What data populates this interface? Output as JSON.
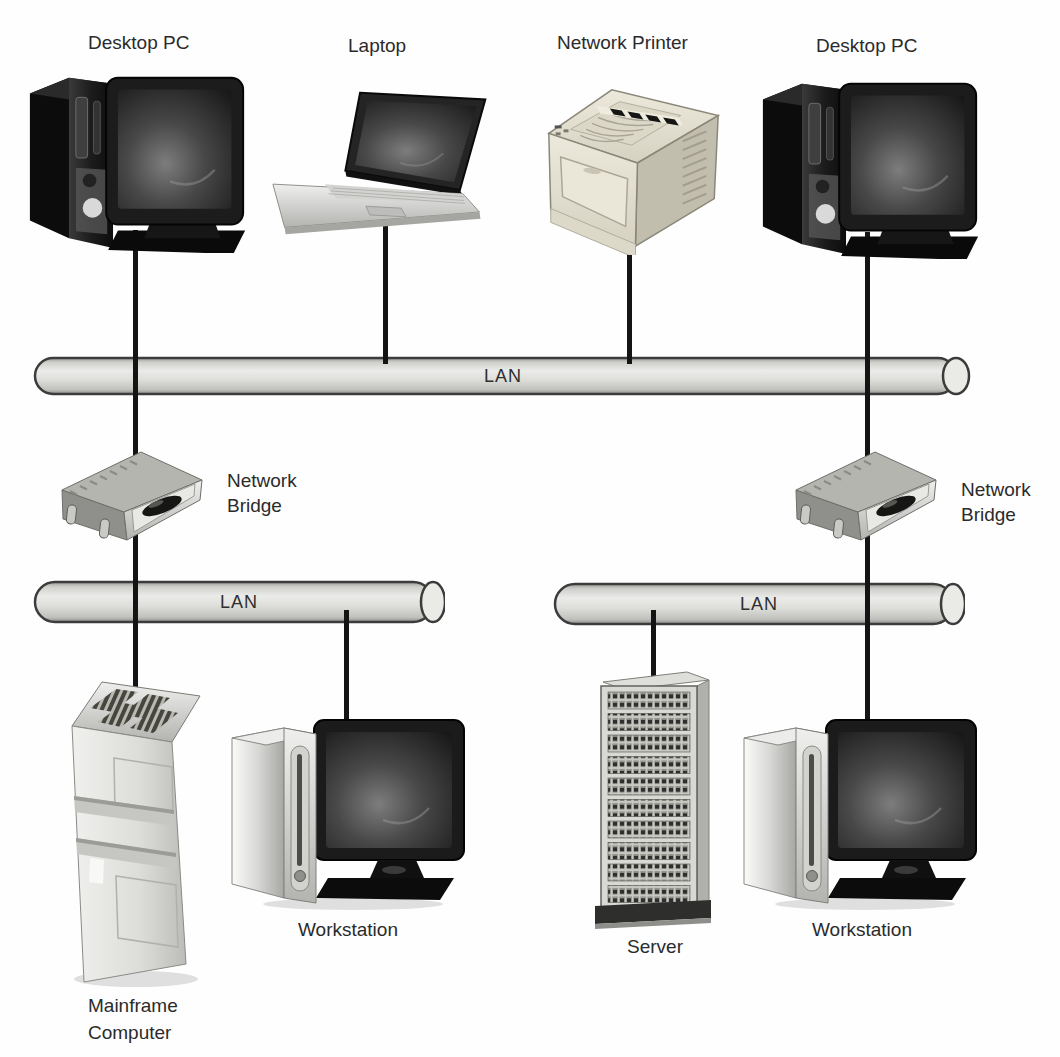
{
  "diagram": {
    "top_devices": [
      {
        "type": "desktop-pc",
        "label": "Desktop PC"
      },
      {
        "type": "laptop",
        "label": "Laptop"
      },
      {
        "type": "network-printer",
        "label": "Network Printer"
      },
      {
        "type": "desktop-pc",
        "label": "Desktop PC"
      }
    ],
    "lans": {
      "top": {
        "label": "LAN"
      },
      "left": {
        "label": "LAN"
      },
      "right": {
        "label": "LAN"
      }
    },
    "bridges": {
      "left": {
        "label": "Network\nBridge"
      },
      "right": {
        "label": "Network\nBridge"
      }
    },
    "bottom_devices": {
      "mainframe": {
        "type": "mainframe",
        "label": "Mainframe\nComputer"
      },
      "workstation_left": {
        "type": "workstation",
        "label": "Workstation"
      },
      "server": {
        "type": "server",
        "label": "Server"
      },
      "workstation_right": {
        "type": "workstation",
        "label": "Workstation"
      }
    },
    "colors": {
      "background": "#fefefe",
      "cable": "#141414",
      "pipe_fill": "#e2e2df",
      "pipe_outline": "#3c3c3c",
      "text": "#2b2b2b"
    }
  }
}
